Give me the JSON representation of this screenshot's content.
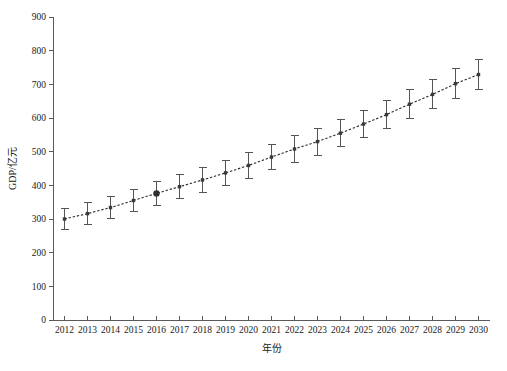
{
  "chart_data": {
    "type": "line",
    "title": "",
    "subtitle": "",
    "xlabel": "年份",
    "ylabel": "GDP/亿元",
    "xlim": [
      2011.5,
      2030.5
    ],
    "ylim": [
      0,
      900
    ],
    "grid": false,
    "legend": null,
    "x_tick_labels": [
      "2012",
      "2013",
      "2014",
      "2015",
      "2016",
      "2017",
      "2018",
      "2019",
      "2020",
      "2021",
      "2022",
      "2023",
      "2024",
      "2025",
      "2026",
      "2027",
      "2028",
      "2029",
      "2030"
    ],
    "y_tick_labels": [
      "0",
      "100",
      "200",
      "300",
      "400",
      "500",
      "600",
      "700",
      "800",
      "900"
    ],
    "y_ticks": [
      0,
      100,
      200,
      300,
      400,
      500,
      600,
      700,
      800,
      900
    ],
    "categories": [
      2012,
      2013,
      2014,
      2015,
      2016,
      2017,
      2018,
      2019,
      2020,
      2021,
      2022,
      2023,
      2024,
      2025,
      2026,
      2027,
      2028,
      2029,
      2030
    ],
    "values": [
      300,
      316,
      334,
      355,
      376,
      396,
      416,
      437,
      459,
      484,
      508,
      530,
      555,
      582,
      610,
      641,
      670,
      702,
      729
    ],
    "error_low": [
      32,
      32,
      33,
      34,
      35,
      36,
      36,
      37,
      38,
      38,
      39,
      40,
      40,
      41,
      42,
      43,
      43,
      44,
      45
    ],
    "error_high": [
      32,
      32,
      33,
      34,
      35,
      36,
      36,
      37,
      38,
      38,
      39,
      40,
      40,
      41,
      42,
      43,
      43,
      44,
      45
    ],
    "highlight_index": 4,
    "series": [
      {
        "name": "GDP",
        "values": [
          300,
          316,
          334,
          355,
          376,
          396,
          416,
          437,
          459,
          484,
          508,
          530,
          555,
          582,
          610,
          641,
          670,
          702,
          729
        ],
        "line_style": "dotted",
        "marker": "square",
        "color": "#2b2b2b"
      }
    ],
    "annotations": []
  },
  "axes": {
    "y_axis_label": "GDP/亿元",
    "x_axis_label": "年份"
  }
}
